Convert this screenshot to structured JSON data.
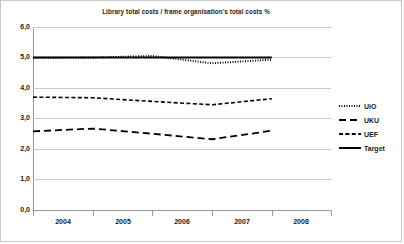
{
  "chart_data": {
    "type": "line",
    "title": "Library total costs / frame organisation's total costs %",
    "xlabel": "",
    "ylabel": "",
    "x": [
      2004,
      2005,
      2006,
      2007,
      2008
    ],
    "categories": [
      "2004",
      "2005",
      "2006",
      "2007",
      "2008"
    ],
    "xtick_labels": [
      "2004",
      "2005",
      "2006",
      "2007",
      "2008"
    ],
    "ytick_labels": [
      "0,0",
      "1,0",
      "2,0",
      "3,0",
      "4,0",
      "5,0",
      "6,0"
    ],
    "ytick_values": [
      0.0,
      1.0,
      2.0,
      3.0,
      4.0,
      5.0,
      6.0
    ],
    "ylim": [
      0.0,
      6.0
    ],
    "grid": "horizontal",
    "legend_position": "right",
    "series": [
      {
        "name": "UiO",
        "style": "dotted",
        "color": "#000000",
        "values": [
          4.99,
          5.0,
          5.05,
          4.81,
          4.93
        ]
      },
      {
        "name": "UKU",
        "style": "dashed-long",
        "color": "#000000",
        "values": [
          2.58,
          2.67,
          2.5,
          2.32,
          2.6
        ]
      },
      {
        "name": "UEF",
        "style": "dashed-short",
        "color": "#000000",
        "values": [
          3.7,
          3.68,
          3.56,
          3.45,
          3.65
        ]
      },
      {
        "name": "Target",
        "style": "solid",
        "color": "#000000",
        "values": [
          5.0,
          5.0,
          5.0,
          5.0,
          5.0
        ]
      }
    ]
  },
  "legend": {
    "items": [
      {
        "label": "UiO",
        "style": "dotted"
      },
      {
        "label": "UKU",
        "style": "dashed-long"
      },
      {
        "label": "UEF",
        "style": "dashed-short"
      },
      {
        "label": "Target",
        "style": "solid"
      }
    ]
  },
  "colors": {
    "line": "#000000",
    "gridline": "#c9c9c9",
    "axis": "#9a9a9a",
    "frame": "#c8c8c8",
    "text": "#1a1a1a"
  }
}
